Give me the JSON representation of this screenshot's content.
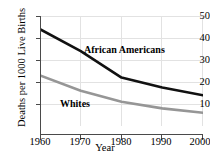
{
  "chart_data": {
    "type": "line",
    "title": "",
    "xlabel": "Year",
    "ylabel": "Deaths per 1000 Live Births",
    "x": [
      1960,
      1970,
      1980,
      1990,
      2000
    ],
    "xticks": [
      "1960",
      "1970",
      "1980",
      "1990",
      "2000"
    ],
    "yticks": [
      "10",
      "20",
      "30",
      "40",
      "50"
    ],
    "xlim": [
      1960,
      2000
    ],
    "ylim": [
      0,
      52
    ],
    "grid": true,
    "legend_position": "inline-annotation",
    "series": [
      {
        "name": "African Americans",
        "color": "#111111",
        "values": [
          44,
          34,
          22,
          17.5,
          14
        ]
      },
      {
        "name": "Whites",
        "color": "#969696",
        "values": [
          23,
          16,
          11,
          8,
          6
        ]
      }
    ],
    "annotations": [
      {
        "text": "African Americans",
        "series": "African Americans"
      },
      {
        "text": "Whites",
        "series": "Whites"
      }
    ]
  },
  "axes": {
    "x_title": "Year",
    "y_title": "Deaths per 1000 Live Births"
  },
  "colors": {
    "grid": "#e2e2e2",
    "axis": "#4a4a4a",
    "background": "#ffffff"
  }
}
